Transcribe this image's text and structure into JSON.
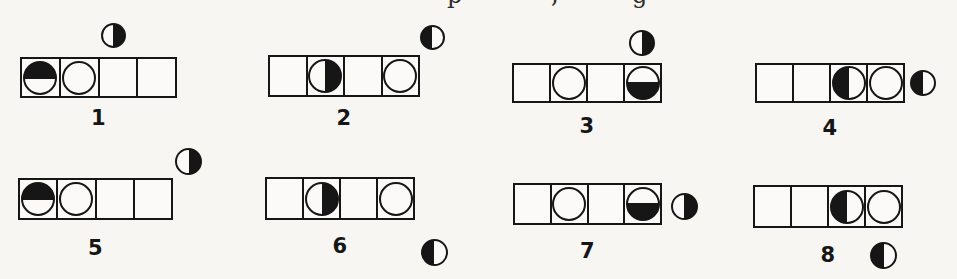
{
  "page": {
    "background": "#f7f6f2",
    "ink": "#161616",
    "cropped_caption_fragments": [
      {
        "char": "p",
        "x": 447
      },
      {
        "char": ",",
        "x": 551
      },
      {
        "char": "g",
        "x": 632
      }
    ]
  },
  "figures": [
    {
      "label": "1",
      "cells": [
        "half-top",
        "circle-open",
        "empty",
        "empty"
      ],
      "marker": {
        "type": "half-right",
        "position": "above-cell-3"
      }
    },
    {
      "label": "2",
      "cells": [
        "empty",
        "half-right",
        "empty",
        "circle-open"
      ],
      "marker": {
        "type": "half-left",
        "position": "above-right-outside"
      }
    },
    {
      "label": "3",
      "cells": [
        "empty",
        "circle-open",
        "empty",
        "half-bottom"
      ],
      "marker": {
        "type": "half-right",
        "position": "above-cell-4"
      }
    },
    {
      "label": "4",
      "cells": [
        "empty",
        "empty",
        "half-left",
        "circle-open"
      ],
      "marker": {
        "type": "half-left",
        "position": "right-of-row"
      }
    },
    {
      "label": "5",
      "cells": [
        "half-top",
        "circle-open",
        "empty",
        "empty"
      ],
      "marker": {
        "type": "half-right",
        "position": "above-right-corner"
      }
    },
    {
      "label": "6",
      "cells": [
        "empty",
        "half-right",
        "empty",
        "circle-open"
      ],
      "marker": {
        "type": "half-left",
        "position": "below-right-outside"
      }
    },
    {
      "label": "7",
      "cells": [
        "empty",
        "circle-open",
        "empty",
        "half-bottom"
      ],
      "marker": {
        "type": "half-right",
        "position": "right-of-row"
      }
    },
    {
      "label": "8",
      "cells": [
        "empty",
        "empty",
        "half-left",
        "circle-open"
      ],
      "marker": {
        "type": "half-left",
        "position": "below-cell-4"
      }
    }
  ]
}
